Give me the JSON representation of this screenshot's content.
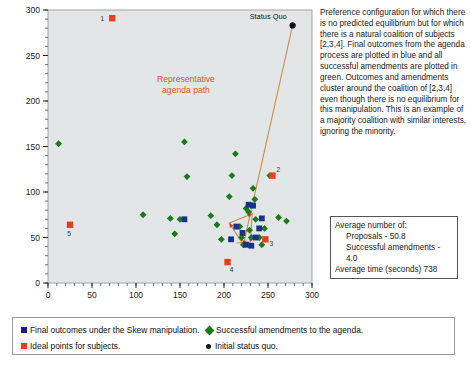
{
  "figure": {
    "xlabel": "X Axis",
    "ylabel": ""
  },
  "description": "Preference configuration for which there is no predicted equilibrium but for which there is a natural coalition of subjects [2,3,4].  Final outcomes from the agenda process are plotted in blue and all successful amendments are plotted in green.  Outcomes and amendments cluster around the coalition of [2,3,4] even though there is no equilibrium for this manipulation.  This is an example of a majority coalition with similar interests, ignoring the minority.",
  "annotations": {
    "status_quo_label": "Status Quo",
    "path_label_line1": "Representative",
    "path_label_line2": "agenda path"
  },
  "stats": {
    "heading": "Average number of:",
    "proposals": "Proposals - 50.8",
    "amendments": "Successful amendments - 4.0",
    "time": "Average time (seconds) 738"
  },
  "legend": {
    "items": [
      {
        "label": "Final outcomes under the Skew manipulation.",
        "marker": "square",
        "color": "#1a1a8c",
        "name": "legend-final-outcomes"
      },
      {
        "label": "Successful amendments to the agenda.",
        "marker": "diamond",
        "color": "#1a7a1a",
        "name": "legend-successful-amendments"
      },
      {
        "label": "Ideal points for subjects.",
        "marker": "square",
        "color": "#ec3f18",
        "name": "legend-ideal-points"
      },
      {
        "label": "Initial status quo.",
        "marker": "circle",
        "color": "#111111",
        "name": "legend-status-quo"
      }
    ]
  },
  "colors": {
    "plot_background": "#e3e6e6",
    "green": "#1a7a1a",
    "blue": "#17318c",
    "orange": "#ec3f18",
    "black": "#111111",
    "path": "#d08a4a",
    "path_text": "#e4572e"
  },
  "chart_data": {
    "type": "scatter",
    "title": "",
    "xlabel": "X Axis",
    "ylabel": "",
    "xlim": [
      0,
      300
    ],
    "ylim": [
      0,
      300
    ],
    "xticks": [
      0,
      50,
      100,
      150,
      200,
      250,
      300
    ],
    "yticks": [
      0,
      50,
      100,
      150,
      200,
      250,
      300
    ],
    "grid": false,
    "legend_position": "below-plot",
    "series": [
      {
        "name": "Successful amendments to the agenda.",
        "marker": "diamond",
        "color": "#1a7a1a",
        "points": [
          [
            12,
            153
          ],
          [
            155,
            155
          ],
          [
            158,
            117
          ],
          [
            108,
            75
          ],
          [
            139,
            71
          ],
          [
            150,
            70
          ],
          [
            144,
            54
          ],
          [
            185,
            74
          ],
          [
            192,
            64
          ],
          [
            197,
            48
          ],
          [
            206,
            95
          ],
          [
            209,
            118
          ],
          [
            213,
            142
          ],
          [
            218,
            62
          ],
          [
            220,
            50
          ],
          [
            222,
            42
          ],
          [
            225,
            82
          ],
          [
            228,
            78
          ],
          [
            229,
            58
          ],
          [
            231,
            50
          ],
          [
            233,
            104
          ],
          [
            235,
            92
          ],
          [
            236,
            70
          ],
          [
            240,
            50
          ],
          [
            243,
            42
          ],
          [
            246,
            60
          ],
          [
            252,
            118
          ],
          [
            262,
            72
          ],
          [
            271,
            68
          ]
        ]
      },
      {
        "name": "Final outcomes under the Skew manipulation.",
        "marker": "square",
        "color": "#17318c",
        "points": [
          [
            155,
            70
          ],
          [
            208,
            48
          ],
          [
            214,
            62
          ],
          [
            221,
            55
          ],
          [
            225,
            42
          ],
          [
            228,
            86
          ],
          [
            231,
            41
          ],
          [
            233,
            85
          ],
          [
            236,
            50
          ],
          [
            240,
            60
          ],
          [
            243,
            71
          ]
        ]
      },
      {
        "name": "Ideal points for subjects.",
        "marker": "square",
        "color": "#ec3f18",
        "points": [
          [
            73,
            291
          ],
          [
            255,
            118
          ],
          [
            247,
            48
          ],
          [
            204,
            23
          ],
          [
            25,
            64
          ]
        ],
        "labels": [
          "1",
          "2",
          "3",
          "4",
          "5"
        ]
      },
      {
        "name": "Initial status quo.",
        "marker": "circle",
        "color": "#111111",
        "points": [
          [
            278,
            283
          ]
        ]
      }
    ],
    "path": {
      "label": "Representative agenda path",
      "color": "#d08a4a",
      "vertices": [
        [
          278,
          283
        ],
        [
          222,
          42
        ],
        [
          206,
          66
        ],
        [
          232,
          76
        ],
        [
          230,
          45
        ],
        [
          214,
          44
        ]
      ]
    }
  }
}
